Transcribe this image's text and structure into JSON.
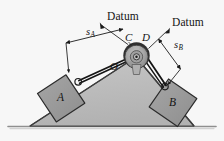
{
  "figure": {
    "title_datum_left": "Datum",
    "title_datum_right": "Datum",
    "labels": {
      "block_a": "A",
      "block_b": "B",
      "point_c": "C",
      "point_d": "D",
      "point_o": "O",
      "dim_a_symbol": "s",
      "dim_a_subscript": "A",
      "dim_b_symbol": "s",
      "dim_b_subscript": "B"
    },
    "colors": {
      "background": "#f7f7f7",
      "incline_fill": "#bdbdbd",
      "incline_edge": "#3a3a3a",
      "block_fill": "#9a9a9a",
      "block_edge": "#2b2b2b",
      "pulley_rim": "#2e2e2e",
      "pulley_face": "#a8a8a8",
      "cable": "#1a1a1a",
      "ground": "#8a8a8a",
      "text": "#141414"
    }
  }
}
